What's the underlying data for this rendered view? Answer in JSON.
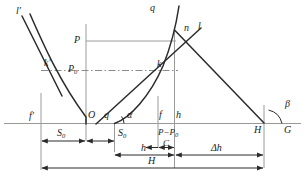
{
  "figure": {
    "type": "engineering-geometry-diagram",
    "width": 305,
    "height": 192,
    "background": "#ffffff",
    "ink": "#2b2b2b",
    "thin_line": "#9a9a9a",
    "dash_line": "#8c8c8c"
  },
  "labels": {
    "l_prime": "l′",
    "k_prime": "k′",
    "f_prime": "f′",
    "P": "P",
    "P0_base": "P",
    "P0_sub": "0",
    "q_top": "q",
    "q_axis": "q",
    "n": "n",
    "l": "l",
    "k": "k",
    "O": "O",
    "alpha": "α",
    "beta": "β",
    "f": "f",
    "h_v": "h",
    "H_axis": "H",
    "G": "G",
    "C": "C",
    "P_minus_P0_base": "P−P",
    "P_minus_P0_sub": "0",
    "S0_left_base": "S",
    "S0_left_sub": "0",
    "S0_right_base": "S",
    "S0_right_sub": "0",
    "h_dim": "h",
    "delta_h_dim": "Δh",
    "H_dim": "H"
  },
  "dimensions": [
    {
      "name": "S0-left",
      "label": "S0",
      "from": "f′",
      "to": "O"
    },
    {
      "name": "S0-right",
      "label": "S0",
      "from": "O",
      "to": "q"
    },
    {
      "name": "C",
      "label": "C",
      "from": "f",
      "to": "h"
    },
    {
      "name": "h",
      "label": "h",
      "from": "q",
      "to": "h"
    },
    {
      "name": "delta-h",
      "label": "Δh",
      "from": "h",
      "to": "H"
    },
    {
      "name": "H",
      "label": "H",
      "from": "f′-base",
      "to": "H"
    }
  ],
  "angles": [
    {
      "name": "alpha",
      "label": "α",
      "at": "q"
    },
    {
      "name": "beta",
      "label": "β",
      "at": "G"
    }
  ],
  "curves": [
    {
      "name": "left-descending-curve",
      "from": "upper-left",
      "to": "O"
    },
    {
      "name": "right-ascending-curve",
      "from": "q",
      "to": "upper-right"
    },
    {
      "name": "line-l-prime",
      "desc": "straight line from l′ through k′ descending"
    },
    {
      "name": "line-l",
      "desc": "straight line from k through n descending to G"
    },
    {
      "name": "line-n-descending",
      "desc": "curve q descending through n to G"
    }
  ]
}
